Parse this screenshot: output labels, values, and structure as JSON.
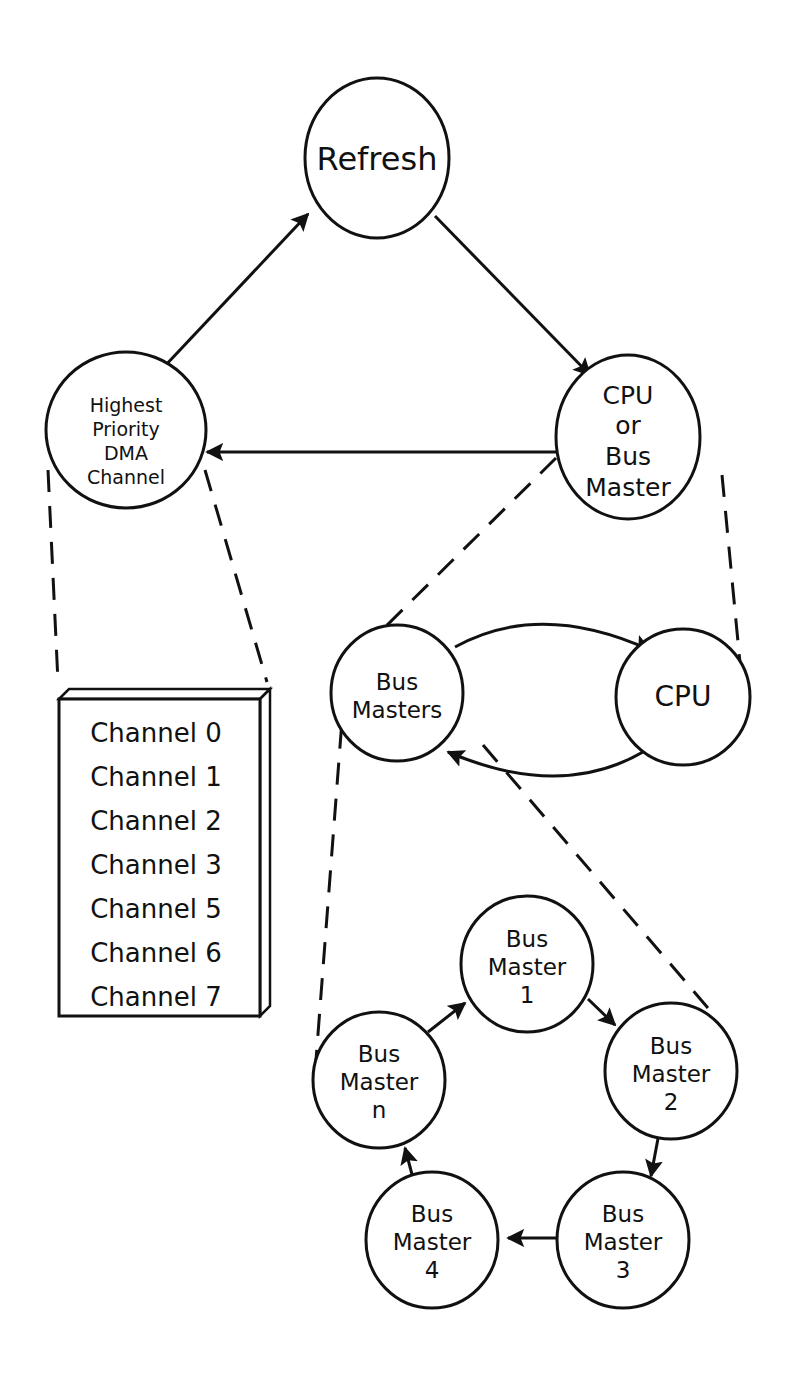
{
  "colors": {
    "ink": "#111111",
    "paper": "#ffffff"
  },
  "nodes": {
    "refresh": {
      "lines": [
        "Refresh"
      ]
    },
    "highest_priority": {
      "lines": [
        "Highest",
        "Priority",
        "DMA",
        "Channel"
      ]
    },
    "cpu_or_bus_master": {
      "lines": [
        "CPU",
        "or",
        "Bus",
        "Master"
      ]
    },
    "bus_masters": {
      "lines": [
        "Bus",
        "Masters"
      ]
    },
    "cpu": {
      "lines": [
        "CPU"
      ]
    },
    "bus_master_1": {
      "lines": [
        "Bus",
        "Master",
        "1"
      ]
    },
    "bus_master_2": {
      "lines": [
        "Bus",
        "Master",
        "2"
      ]
    },
    "bus_master_3": {
      "lines": [
        "Bus",
        "Master",
        "3"
      ]
    },
    "bus_master_4": {
      "lines": [
        "Bus",
        "Master",
        "4"
      ]
    },
    "bus_master_n": {
      "lines": [
        "Bus",
        "Master",
        "n"
      ]
    }
  },
  "channel_list": {
    "items": [
      "Channel 0",
      "Channel 1",
      "Channel 2",
      "Channel 3",
      "Channel 5",
      "Channel 6",
      "Channel 7"
    ]
  },
  "edges": [
    {
      "from": "Highest Priority DMA Channel",
      "to": "Refresh",
      "style": "solid-arrow"
    },
    {
      "from": "Refresh",
      "to": "CPU or Bus Master",
      "style": "solid-arrow"
    },
    {
      "from": "CPU or Bus Master",
      "to": "Highest Priority DMA Channel",
      "style": "solid-arrow"
    },
    {
      "from": "Bus Masters",
      "to": "CPU",
      "style": "curved-arrow"
    },
    {
      "from": "CPU",
      "to": "Bus Masters",
      "style": "curved-arrow"
    },
    {
      "from": "Bus Master n",
      "to": "Bus Master 1",
      "style": "solid-arrow"
    },
    {
      "from": "Bus Master 1",
      "to": "Bus Master 2",
      "style": "solid-arrow"
    },
    {
      "from": "Bus Master 2",
      "to": "Bus Master 3",
      "style": "solid-arrow"
    },
    {
      "from": "Bus Master 3",
      "to": "Bus Master 4",
      "style": "solid-arrow"
    },
    {
      "from": "Bus Master 4",
      "to": "Bus Master n",
      "style": "solid-arrow"
    }
  ],
  "expansions": [
    {
      "node": "Highest Priority DMA Channel",
      "expands_to": "Channel list",
      "style": "dashed"
    },
    {
      "node": "CPU or Bus Master",
      "expands_to": "Bus Masters / CPU",
      "style": "dashed"
    },
    {
      "node": "Bus Masters",
      "expands_to": "Bus Master ring",
      "style": "dashed"
    }
  ]
}
